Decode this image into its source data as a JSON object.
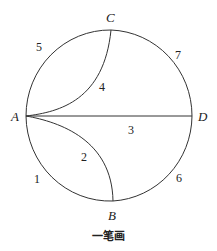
{
  "figure": {
    "caption": "一笔画",
    "vertices": {
      "A": "A",
      "B": "B",
      "C": "C",
      "D": "D"
    },
    "edges": [
      {
        "id": "1",
        "label": "1",
        "from": "A",
        "to": "B",
        "kind": "outer circle arc (lower-left)"
      },
      {
        "id": "2",
        "label": "2",
        "from": "A",
        "to": "B",
        "kind": "inner curve"
      },
      {
        "id": "3",
        "label": "3",
        "from": "A",
        "to": "D",
        "kind": "straight line (diameter)"
      },
      {
        "id": "4",
        "label": "4",
        "from": "A",
        "to": "C",
        "kind": "inner curve"
      },
      {
        "id": "5",
        "label": "5",
        "from": "A",
        "to": "C",
        "kind": "outer circle arc (upper-left)"
      },
      {
        "id": "6",
        "label": "6",
        "from": "B",
        "to": "D",
        "kind": "outer circle arc (lower-right)"
      },
      {
        "id": "7",
        "label": "7",
        "from": "C",
        "to": "D",
        "kind": "outer circle arc (upper-right)"
      }
    ],
    "colors": {
      "stroke": "#333333",
      "text": "#222222",
      "background": "#ffffff"
    }
  }
}
